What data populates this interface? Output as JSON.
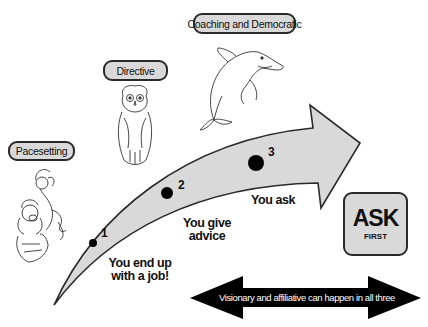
{
  "styles": {
    "labels": [
      {
        "id": "pacesetting",
        "text": "Pacesetting",
        "illustration": "monkey-on-stressed-man"
      },
      {
        "id": "directive",
        "text": "Directive",
        "illustration": "owl"
      },
      {
        "id": "coaching",
        "text": "Coaching and Democratic",
        "illustration": "dolphin"
      }
    ]
  },
  "progression": {
    "steps": [
      {
        "number": "1",
        "caption_line1": "You end up",
        "caption_line2": "with a job!"
      },
      {
        "number": "2",
        "caption_line1": "You give",
        "caption_line2": "advice"
      },
      {
        "number": "3",
        "caption_line1": "You ask",
        "caption_line2": ""
      }
    ]
  },
  "callout": {
    "main": "ASK",
    "sub": "FIRST"
  },
  "banner": {
    "text": "Visionary and affiliative can happen in all three"
  },
  "colors": {
    "arrow_fill": "#d9d9d9",
    "outline": "#2a2a2a",
    "banner_fill": "#000000",
    "banner_text": "#ffffff"
  }
}
